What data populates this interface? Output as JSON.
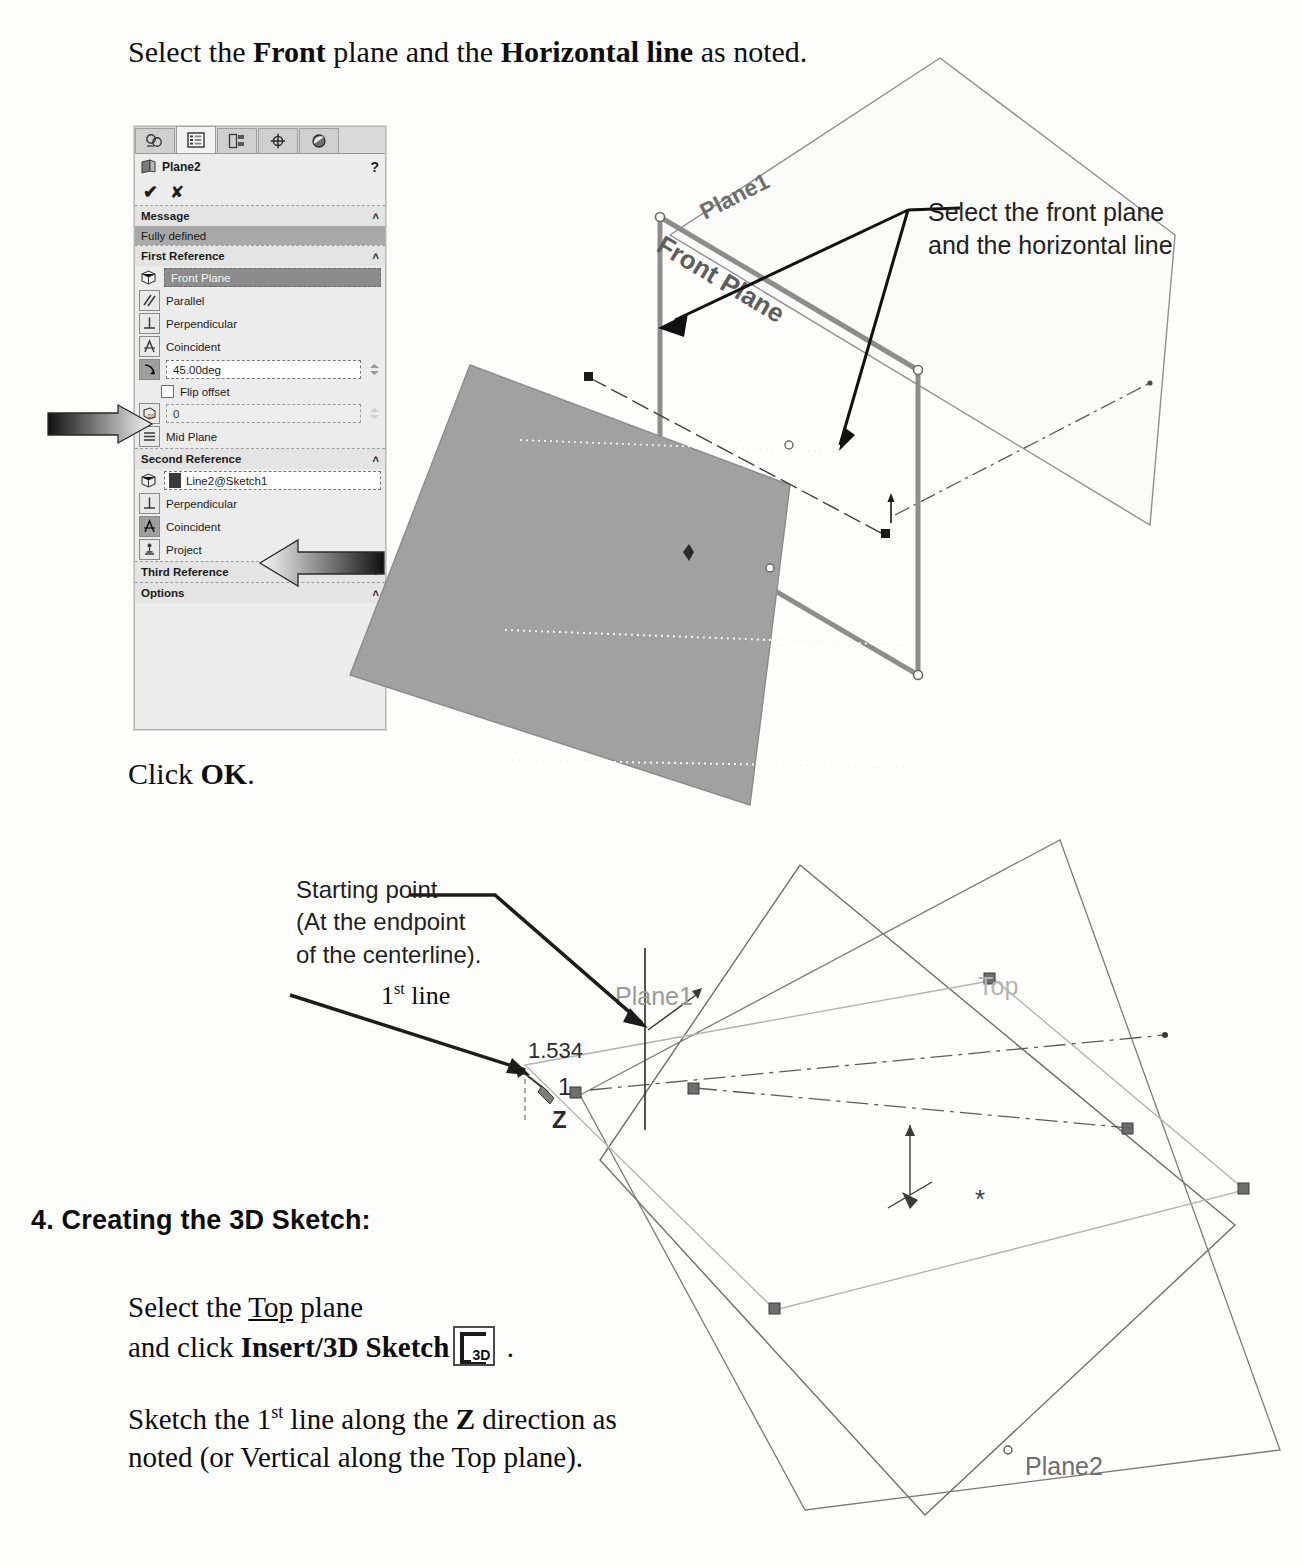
{
  "document": {
    "top_instruction": {
      "prefix": "Select the ",
      "bold1": "Front",
      "middle": " plane and the ",
      "bold2": "Horizontal line",
      "suffix": " as noted."
    },
    "click_ok": {
      "prefix": "Click ",
      "bold": "OK",
      "suffix": "."
    },
    "section_heading": "4. Creating the 3D Sketch:",
    "bottom_instruction_1": {
      "line1_prefix": "Select the ",
      "line1_underline": "Top",
      "line1_suffix": " plane",
      "line2_prefix": "and click ",
      "line2_bold": "Insert/3D Sketch",
      "line2_suffix": " ."
    },
    "bottom_instruction_2": {
      "line1_prefix": "Sketch the 1",
      "line1_sup": "st",
      "line1_mid": " line along the ",
      "line1_bold": "Z",
      "line1_suffix": " direction as",
      "line2": "noted (or Vertical along the Top plane)."
    },
    "icon_3d_label": "3D"
  },
  "property_manager": {
    "title": "Plane2",
    "help_glyph": "?",
    "accept_glyph": "✔",
    "cancel_glyph": "✘",
    "tabs": [
      {
        "name": "feature-manager-design-tree-tab"
      },
      {
        "name": "property-manager-tab"
      },
      {
        "name": "configuration-manager-tab"
      },
      {
        "name": "dimxpert-manager-tab"
      },
      {
        "name": "display-manager-tab"
      }
    ],
    "sections": {
      "message": {
        "label": "Message",
        "caret": "˄",
        "status": "Fully defined"
      },
      "first_reference": {
        "label": "First Reference",
        "caret": "˄",
        "selection": "Front Plane",
        "constraints": [
          {
            "label": "Parallel",
            "selected": false
          },
          {
            "label": "Perpendicular",
            "selected": false
          },
          {
            "label": "Coincident",
            "selected": false
          }
        ],
        "angle_value": "45.00deg",
        "flip_offset_label": "Flip offset",
        "flip_offset_checked": false,
        "distance_value": "0",
        "mid_plane_label": "Mid Plane"
      },
      "second_reference": {
        "label": "Second Reference",
        "caret": "˄",
        "selection": "Line2@Sketch1",
        "constraints": [
          {
            "label": "Perpendicular",
            "selected": false
          },
          {
            "label": "Coincident",
            "selected": true
          },
          {
            "label": "Project",
            "selected": false
          }
        ]
      },
      "third_reference": {
        "label": "Third Reference",
        "caret": "˅"
      },
      "options": {
        "label": "Options",
        "caret": "˄"
      }
    }
  },
  "viewport_top": {
    "callout": {
      "line1": "Select the front plane",
      "line2": "and the horizontal line"
    },
    "labels": {
      "plane1": "Plane1",
      "front_plane": "Front Plane"
    }
  },
  "viewport_bottom": {
    "callouts": {
      "starting_point": {
        "line1": "Starting point",
        "line2": "(At the endpoint",
        "line3": "of the centerline)."
      },
      "first_line": {
        "prefix": "1",
        "sup": "st",
        "suffix": " line"
      }
    },
    "labels": {
      "plane1": "Plane1",
      "top": "Top",
      "plane2": "Plane2",
      "dimension": "1.534",
      "axis_1": "1",
      "axis_z": "Z"
    }
  },
  "colors": {
    "page_background": "#fdfdfc",
    "panel_background": "#ececec",
    "panel_header": "#e4e4e4",
    "selection_fill": "#8c8c8c",
    "message_bar": "#a9a9a9",
    "plane_fill": "#a0a0a0",
    "plane_edge": "#8a8a8a",
    "annotation_text": "#231f20",
    "body_text": "#0d0d0d"
  }
}
